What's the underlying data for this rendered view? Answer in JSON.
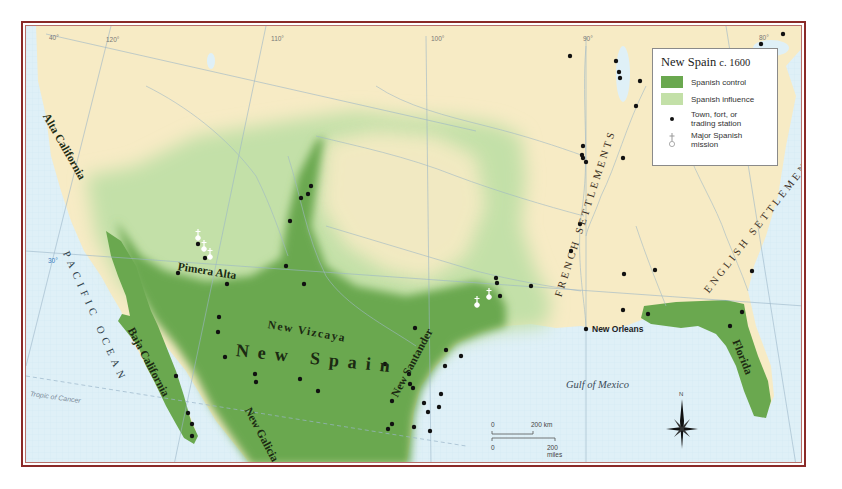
{
  "legend": {
    "title": "New Spain",
    "title_date": "c. 1600",
    "items": [
      {
        "label": "Spanish control",
        "color": "#6aa84f"
      },
      {
        "label": "Spanish influence",
        "color": "#c3e0a8"
      },
      {
        "label": "Town, fort, or trading station",
        "symbol": "dot"
      },
      {
        "label": "Major Spanish mission",
        "symbol": "mission"
      }
    ]
  },
  "labels": {
    "alta_california": "Alta California",
    "baja_california": "Baja California",
    "pimera_alta": "Pimera Alta",
    "new_vizcaya": "New Vizcaya",
    "new_spain": "New Spain",
    "new_galicia": "New Galicia",
    "new_santander": "New Santander",
    "florida": "Florida",
    "french_settlements": "FRENCH SETTLEMENTS",
    "english_settlements": "ENGLISH SETTLEMENTS",
    "pacific_ocean": "PACIFIC OCEAN",
    "gulf_of_mexico": "Gulf of Mexico",
    "new_orleans": "New Orleans",
    "tropic_of_cancer": "Tropic of Cancer"
  },
  "graticule": {
    "lat_40": "40°",
    "lon_120": "120°",
    "lon_110": "110°",
    "lon_100": "100°",
    "lon_90": "90°",
    "lon_80": "80°",
    "lat_30": "30°"
  },
  "scale_bar": {
    "km_zero": "0",
    "km_label": "200 km",
    "mi_zero": "0",
    "mi_label": "200 miles"
  },
  "compass": {
    "north": "N"
  },
  "colors": {
    "land": "#f7ebc5",
    "water": "#dff0f7",
    "control": "#6aa84f",
    "influence": "#c3e0a8",
    "frame": "#8a2a28"
  }
}
